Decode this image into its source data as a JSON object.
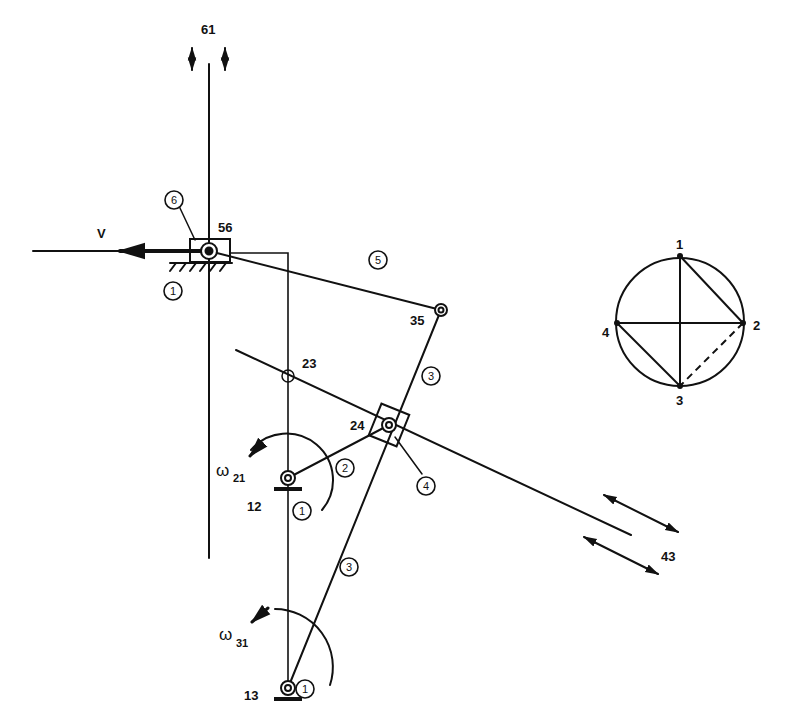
{
  "diagram": {
    "type": "mechanism-linkage-instant-centers",
    "stroke_color": "#111111",
    "background": "#ffffff",
    "joint_labels": {
      "j61": "61",
      "j56": "56",
      "j35": "35",
      "j23": "23",
      "j24": "24",
      "j12": "12",
      "j13": "13",
      "j43": "43"
    },
    "velocity_label": "V",
    "omega_labels": {
      "w21": {
        "symbol": "ω",
        "sub": "21"
      },
      "w31": {
        "symbol": "ω",
        "sub": "31"
      }
    },
    "link_numbers": {
      "link6": "6",
      "link1_top": "1",
      "link5": "5",
      "link3_upper": "3",
      "link2": "2",
      "link4": "4",
      "link1_mid": "1",
      "link3_lower": "3",
      "link1_bottom": "1"
    },
    "circle_graph": {
      "nodes": [
        "1",
        "2",
        "3",
        "4"
      ],
      "solid_edges": [
        [
          "1",
          "3"
        ],
        [
          "1",
          "2"
        ],
        [
          "4",
          "2"
        ],
        [
          "4",
          "3"
        ]
      ],
      "dashed_edges": [
        [
          "2",
          "3"
        ]
      ]
    }
  }
}
